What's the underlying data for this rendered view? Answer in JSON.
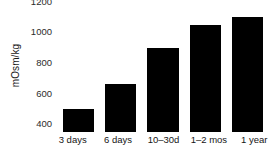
{
  "chart_data": {
    "type": "bar",
    "title": "",
    "subtitle": "",
    "xlabel": "",
    "ylabel": "mOsm/kg",
    "categories": [
      "3 days",
      "6 days",
      "10–30d",
      "1–2 mos",
      "1 year"
    ],
    "values": [
      500,
      660,
      895,
      1045,
      1100
    ],
    "ylim": [
      350,
      1210
    ],
    "yticks": [
      400,
      600,
      800,
      1000,
      1200
    ],
    "ytick_labels": [
      "400",
      "600",
      "800",
      "1000",
      "1200"
    ],
    "grid": false,
    "legend": null,
    "series": [
      {
        "name": "Urine osmolality",
        "values": [
          500,
          660,
          895,
          1045,
          1100
        ]
      }
    ],
    "bar_color": "#000000",
    "background_color": "#ffffff",
    "axis_lines": false
  },
  "colors": {
    "bar": "#000000",
    "text": "#1a1a1a",
    "tick_text": "#2b2b2b",
    "background": "#ffffff"
  }
}
